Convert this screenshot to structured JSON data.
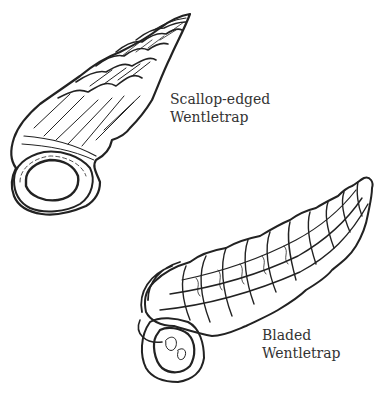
{
  "illustrations": [
    {
      "name": "scallop-edged-wentletrap",
      "label_line1": "Scallop-edged",
      "label_line2": "Wentletrap"
    },
    {
      "name": "bladed-wentletrap",
      "label_line1": "Bladed",
      "label_line2": "Wentletrap"
    }
  ],
  "colors": {
    "ink": "#222222",
    "background": "#ffffff",
    "text": "#333333"
  }
}
